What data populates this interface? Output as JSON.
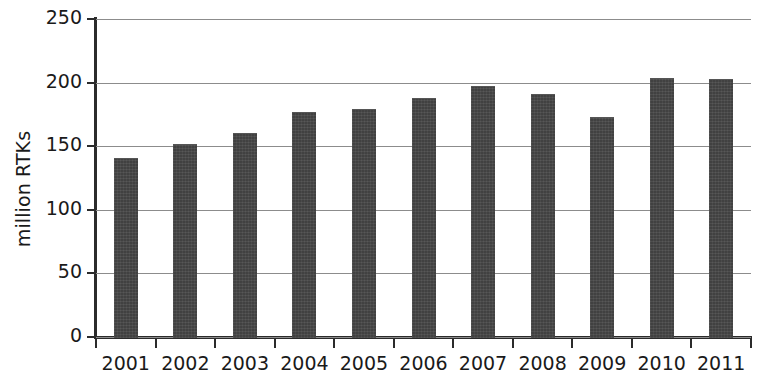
{
  "chart_data": {
    "type": "bar",
    "title": "",
    "subtitle": "",
    "xlabel": "",
    "ylabel": "million RTKs",
    "categories": [
      "2001",
      "2002",
      "2003",
      "2004",
      "2005",
      "2006",
      "2007",
      "2008",
      "2009",
      "2010",
      "2011"
    ],
    "values": [
      141,
      152,
      160,
      177,
      179,
      188,
      197,
      191,
      173,
      204,
      203
    ],
    "ylim": [
      0,
      250
    ],
    "yticks": [
      0,
      50,
      100,
      150,
      200,
      250
    ],
    "ytick_labels": [
      "0",
      "50",
      "100",
      "150",
      "200",
      "250"
    ],
    "grid": "horizontal",
    "legend": "none",
    "bar_color": "#474747",
    "gridline_color": "#8c8c8c",
    "axis_color": "#2b2b2b",
    "background_color": "#ffffff"
  }
}
